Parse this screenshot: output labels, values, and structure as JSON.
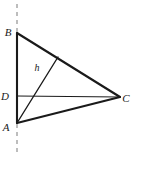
{
  "figure": {
    "canvas": {
      "width": 143,
      "height": 173,
      "background": "#ffffff"
    },
    "stroke_color": "#1a1a1a",
    "dash_color": "#9a9a9a",
    "points": {
      "B": {
        "x": 17,
        "y": 33,
        "label": "B",
        "label_x": 8,
        "label_y": 36
      },
      "D": {
        "x": 17,
        "y": 96,
        "label": "D",
        "label_x": 5,
        "label_y": 100
      },
      "A": {
        "x": 17,
        "y": 123,
        "label": "A",
        "label_x": 6,
        "label_y": 131
      },
      "C": {
        "x": 120,
        "y": 97,
        "label": "C",
        "label_x": 126,
        "label_y": 102
      },
      "H": {
        "x": 58,
        "y": 57,
        "label": "",
        "label_x": 0,
        "label_y": 0
      }
    },
    "segments": [
      {
        "name": "side-AB",
        "from": "B",
        "to": "A",
        "width": 2.1
      },
      {
        "name": "side-BC",
        "from": "B",
        "to": "C",
        "width": 2.1
      },
      {
        "name": "side-AC",
        "from": "A",
        "to": "C",
        "width": 2.1
      },
      {
        "name": "segment-DC",
        "from": "D",
        "to": "C",
        "width": 1.1
      },
      {
        "name": "altitude-AH",
        "from": "A",
        "to": "H",
        "width": 1.4
      }
    ],
    "dashed_axis": {
      "name": "dashed-vertical-axis",
      "x": 17,
      "y_top": 4,
      "y_bottom": 153,
      "width": 1.3,
      "dash_pattern": "4 4"
    },
    "labels": {
      "h": {
        "text": "h",
        "x": 37,
        "y": 71
      }
    }
  }
}
